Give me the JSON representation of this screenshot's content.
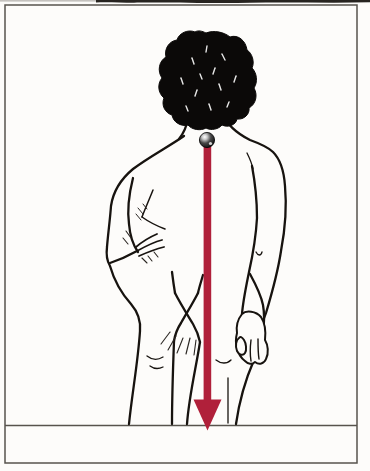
{
  "illustration": {
    "name": "posterior-posture-plumb-line",
    "elements": {
      "figure": "standing human figure, posterior view, pen-and-ink line drawing",
      "hair": "solid black hair mass with white glints",
      "marker_ball": "small reflective sphere marker at the cervicothoracic junction (base of neck)",
      "plumb_arrow": "vertical red arrow dropping from the neck marker down to the floor",
      "floor_line": "horizontal ground line spanning the frame",
      "frame": "thin rectangular border around the illustration",
      "scan_artifact": "dark smudge along the top edge of the scan"
    },
    "colors": {
      "background": "#fdfcfa",
      "ink": "#17130f",
      "hair_black": "#0b0908",
      "arrow_red": "#b0203a",
      "frame_gray": "#57534d"
    }
  }
}
